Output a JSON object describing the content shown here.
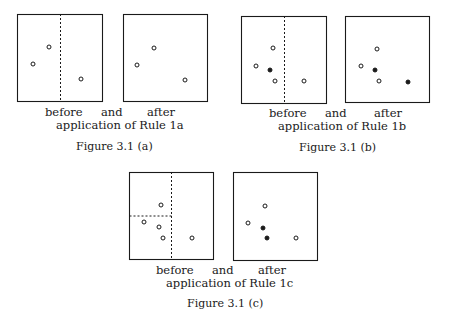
{
  "figures": [
    {
      "id": "a",
      "caption": "Figure 3.1 (a)",
      "before_label": "before",
      "and_label": "and",
      "after_label": "after",
      "application_label": "application of Rule 1a",
      "panels": {
        "before": {
          "box": [
            17,
            14,
            102,
            101
          ],
          "dashed_lines": [
            {
              "x1": 60,
              "y1": 14,
              "x2": 60,
              "y2": 101
            }
          ],
          "points": [
            {
              "x": 49,
              "y": 47,
              "filled": false
            },
            {
              "x": 33,
              "y": 64,
              "filled": false
            },
            {
              "x": 81,
              "y": 79,
              "filled": false
            }
          ]
        },
        "after": {
          "box": [
            123,
            14,
            207,
            101
          ],
          "dashed_lines": [],
          "points": [
            {
              "x": 154,
              "y": 48,
              "filled": false
            },
            {
              "x": 137,
              "y": 65,
              "filled": false
            },
            {
              "x": 185,
              "y": 80,
              "filled": false
            }
          ]
        }
      }
    },
    {
      "id": "b",
      "caption": "Figure 3.1 (b)",
      "before_label": "before",
      "and_label": "and",
      "after_label": "after",
      "application_label": "application of Rule 1b",
      "panels": {
        "before": {
          "box": [
            241,
            16,
            326,
            103
          ],
          "dashed_lines": [
            {
              "x1": 284,
              "y1": 16,
              "x2": 284,
              "y2": 103
            }
          ],
          "points": [
            {
              "x": 273,
              "y": 48,
              "filled": false
            },
            {
              "x": 256,
              "y": 66,
              "filled": false
            },
            {
              "x": 270,
              "y": 70,
              "filled": true
            },
            {
              "x": 275,
              "y": 81,
              "filled": false
            },
            {
              "x": 304,
              "y": 81,
              "filled": false
            }
          ]
        },
        "after": {
          "box": [
            345,
            16,
            429,
            102
          ],
          "dashed_lines": [],
          "points": [
            {
              "x": 377,
              "y": 49,
              "filled": false
            },
            {
              "x": 361,
              "y": 66,
              "filled": false
            },
            {
              "x": 375,
              "y": 70,
              "filled": true
            },
            {
              "x": 379,
              "y": 81,
              "filled": false
            },
            {
              "x": 408,
              "y": 82,
              "filled": true
            }
          ]
        }
      }
    },
    {
      "id": "c",
      "caption": "Figure 3.1 (c)",
      "before_label": "before",
      "and_label": "and",
      "after_label": "after",
      "application_label": "application of Rule 1c",
      "panels": {
        "before": {
          "box": [
            129,
            172,
            213,
            259
          ],
          "dashed_lines": [
            {
              "x1": 171,
              "y1": 172,
              "x2": 171,
              "y2": 259
            },
            {
              "x1": 129,
              "y1": 216,
              "x2": 171,
              "y2": 216
            }
          ],
          "points": [
            {
              "x": 161,
              "y": 205,
              "filled": false
            },
            {
              "x": 144,
              "y": 222,
              "filled": false
            },
            {
              "x": 159,
              "y": 227,
              "filled": false
            },
            {
              "x": 163,
              "y": 238,
              "filled": false
            },
            {
              "x": 192,
              "y": 238,
              "filled": false
            }
          ]
        },
        "after": {
          "box": [
            233,
            172,
            317,
            260
          ],
          "dashed_lines": [],
          "points": [
            {
              "x": 265,
              "y": 206,
              "filled": false
            },
            {
              "x": 248,
              "y": 223,
              "filled": false
            },
            {
              "x": 263,
              "y": 228,
              "filled": true
            },
            {
              "x": 267,
              "y": 238,
              "filled": true
            },
            {
              "x": 296,
              "y": 238,
              "filled": false
            }
          ]
        }
      }
    }
  ],
  "colors": {
    "ink": "#1a1a1a",
    "background": "#ffffff"
  }
}
